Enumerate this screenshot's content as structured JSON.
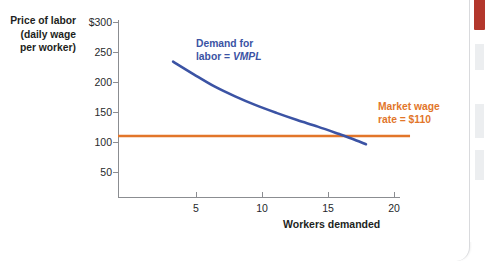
{
  "chart_data": {
    "type": "line",
    "title": "",
    "xlabel": "Workers demanded",
    "ylabel_lines": [
      "Price of labor",
      "(daily wage",
      "per worker)"
    ],
    "xlim": [
      0,
      21.2
    ],
    "ylim": [
      0,
      310
    ],
    "grid": false,
    "legend_position": "inline-annotation",
    "xticks": [
      5,
      10,
      15,
      20
    ],
    "xtick_labels": [
      "5",
      "10",
      "15",
      "20"
    ],
    "yticks": [
      50,
      100,
      150,
      200,
      250,
      300
    ],
    "ytick_labels": [
      "50",
      "100",
      "150",
      "200",
      "250",
      "$300"
    ],
    "series": [
      {
        "name": "Demand for labor = VMPL",
        "color": "#3b53a4",
        "type": "line",
        "x": [
          4.0,
          5.5,
          7.0,
          8.5,
          10.0,
          11.5,
          13.0,
          14.5,
          16.0,
          17.0,
          18.0
        ],
        "values": [
          245,
          222,
          200,
          182,
          166,
          152,
          139,
          127,
          114,
          105,
          95
        ]
      },
      {
        "name": "Market wage rate = $110",
        "color": "#e2762a",
        "type": "line",
        "x": [
          0,
          21.2
        ],
        "values": [
          110,
          110
        ]
      }
    ],
    "annotations": [
      {
        "text_lines": [
          "Demand  for",
          "labor = VMPL"
        ],
        "italic_part": "VMPL",
        "color": "#3b53a4",
        "x": 6.2,
        "y": 268
      },
      {
        "text_lines": [
          "Market wage",
          "rate = $110"
        ],
        "color": "#e2762a",
        "x": 19.6,
        "y": 160
      }
    ],
    "intersection": {
      "x": 15.5,
      "y": 110
    }
  },
  "y_axis": {
    "title_line_1": "Price of labor",
    "title_line_2": "(daily wage",
    "title_line_3": "per worker)",
    "labels": [
      "$300",
      "250",
      "200",
      "150",
      "100",
      "50"
    ]
  },
  "x_axis": {
    "title": "Workers demanded",
    "labels": [
      "5",
      "10",
      "15",
      "20"
    ]
  },
  "annotations": {
    "demand_line_1": "Demand  for",
    "demand_line_2_prefix": "labor = ",
    "demand_line_2_italic": "VMPL",
    "wage_line_1": "Market wage",
    "wage_line_2": "rate = $110"
  },
  "colors": {
    "demand_curve": "#3b53a4",
    "wage_line": "#e2762a",
    "axis": "#8b8d91",
    "text": "#1d1f22",
    "rail_accent": "#b3372c",
    "card_border": "#d9dadd"
  }
}
